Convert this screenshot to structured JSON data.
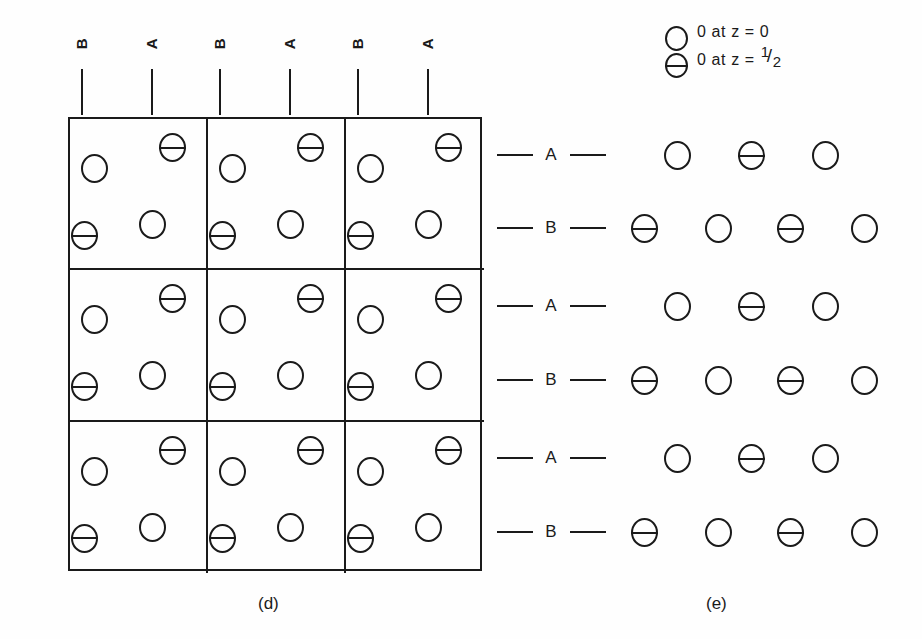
{
  "figure": {
    "background_color": "#fefefe",
    "ink_color": "#1a1a1a"
  },
  "legend": {
    "entries": [
      {
        "symbol": "open-circle",
        "label": "0 at z = 0",
        "z_value": "0"
      },
      {
        "symbol": "barred-circle",
        "label_prefix": "0 at  z = ",
        "numerator": "1",
        "slash": "/",
        "denominator": "2",
        "z_value": "1/2"
      }
    ]
  },
  "panel_d": {
    "caption": "(d)",
    "axis_labels": [
      "B",
      "A",
      "B",
      "A",
      "B",
      "A"
    ],
    "grid": {
      "rows": 3,
      "cols": 3,
      "cell_atoms": [
        {
          "position": "top-left",
          "symbol": "open-circle",
          "z": "0"
        },
        {
          "position": "top-right",
          "symbol": "barred-circle",
          "z": "1/2"
        },
        {
          "position": "bottom-left",
          "symbol": "barred-circle",
          "z": "1/2"
        },
        {
          "position": "bottom-right",
          "symbol": "open-circle",
          "z": "0"
        }
      ]
    }
  },
  "panel_e": {
    "caption": "(e)",
    "layers": [
      {
        "label": "A",
        "atoms": [
          "open-circle",
          "barred-circle",
          "open-circle"
        ]
      },
      {
        "label": "B",
        "atoms": [
          "barred-circle",
          "open-circle",
          "barred-circle",
          "open-circle"
        ]
      },
      {
        "label": "A",
        "atoms": [
          "open-circle",
          "barred-circle",
          "open-circle"
        ]
      },
      {
        "label": "B",
        "atoms": [
          "barred-circle",
          "open-circle",
          "barred-circle",
          "open-circle"
        ]
      },
      {
        "label": "A",
        "atoms": [
          "open-circle",
          "barred-circle",
          "open-circle"
        ]
      },
      {
        "label": "B",
        "atoms": [
          "barred-circle",
          "open-circle",
          "barred-circle",
          "open-circle"
        ]
      }
    ]
  }
}
